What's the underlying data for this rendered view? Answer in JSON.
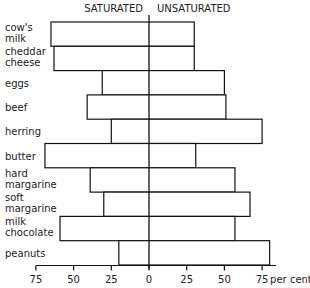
{
  "chart_data": {
    "type": "bar",
    "orientation": "horizontal-diverging",
    "title": "",
    "headers": {
      "left": "SATURATED",
      "right": "UNSATURATED"
    },
    "categories": [
      [
        "cow's",
        "milk"
      ],
      [
        "cheddar",
        "cheese"
      ],
      [
        "eggs"
      ],
      [
        "beef"
      ],
      [
        "herring"
      ],
      [
        "butter"
      ],
      [
        "hard",
        "margarine"
      ],
      [
        "soft",
        "margarine"
      ],
      [
        "milk",
        "chocolate"
      ],
      [
        "peanuts"
      ]
    ],
    "series": [
      {
        "name": "Saturated",
        "direction": "left",
        "values": [
          65,
          63,
          31,
          41,
          25,
          69,
          39,
          30,
          59,
          20
        ]
      },
      {
        "name": "Unsaturated",
        "direction": "right",
        "values": [
          30,
          30,
          50,
          51,
          75,
          31,
          57,
          67,
          57,
          80
        ]
      }
    ],
    "xaxis": {
      "ticks": [
        {
          "value": -75,
          "label": "75"
        },
        {
          "value": -50,
          "label": "50"
        },
        {
          "value": -25,
          "label": "25"
        },
        {
          "value": 0,
          "label": "0"
        },
        {
          "value": 25,
          "label": "25"
        },
        {
          "value": 50,
          "label": "50"
        },
        {
          "value": 75,
          "label": "75"
        }
      ],
      "unit_label": "per cent",
      "range": [
        -75,
        82
      ]
    },
    "xlabel": "per cent",
    "ylabel": "",
    "grid": false,
    "legend": "none"
  }
}
